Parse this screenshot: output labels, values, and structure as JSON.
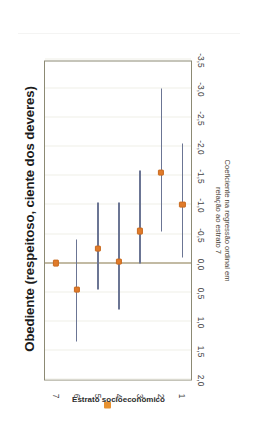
{
  "chart_data": {
    "type": "scatter",
    "title": "Obediente (respeitoso, ciente dos deveres)",
    "xlabel": "Estrato socioeconômico",
    "ylabel": "Coeficiente na regressão ordinal em relação ao estrato 7",
    "ylabel_line1": "Coeficiente  na regressão ordinal em",
    "ylabel_line2": "relação ao estrato 7",
    "orientation": "rotated-90-ccw",
    "grid": true,
    "legend": "none",
    "categories": [
      "1",
      "2",
      "3",
      "4",
      "5",
      "6",
      "7"
    ],
    "ylim": [
      -3.5,
      2.0
    ],
    "ytick_labels": [
      "2,0",
      "1,5",
      "1,0",
      "0,5",
      "0,0",
      "-0,5",
      "-1,0",
      "-1,5",
      "-2,0",
      "-2,5",
      "-3,0",
      "-3,5"
    ],
    "ytick_values": [
      2.0,
      1.5,
      1.0,
      0.5,
      0.0,
      -0.5,
      -1.0,
      -1.5,
      -2.0,
      -2.5,
      -3.0,
      -3.5
    ],
    "zero_reference": 0.0,
    "series": [
      {
        "name": "Coeficiente",
        "point_color": "#e07b2a",
        "errorbar_color": "#6b7594",
        "points": [
          {
            "category": "1",
            "value": -1.0,
            "low": -2.05,
            "high": -0.1
          },
          {
            "category": "2",
            "value": -1.55,
            "low": -3.0,
            "high": -0.55
          },
          {
            "category": "3",
            "value": -0.55,
            "low": -1.6,
            "high": 0.0
          },
          {
            "category": "4",
            "value": -0.02,
            "low": -1.05,
            "high": 0.8
          },
          {
            "category": "5",
            "value": -0.25,
            "low": -1.05,
            "high": 0.45
          },
          {
            "category": "6",
            "value": 0.45,
            "low": -0.4,
            "high": 1.35
          },
          {
            "category": "7",
            "value": 0.0,
            "low": 0.0,
            "high": 0.0
          }
        ]
      }
    ]
  },
  "colors": {
    "accent_orange": "#e07b2a",
    "errorbar_blue": "#6b7594",
    "zeroline": "#8e7f55",
    "frame": "#8c8a74",
    "grid": "#efefe8"
  }
}
